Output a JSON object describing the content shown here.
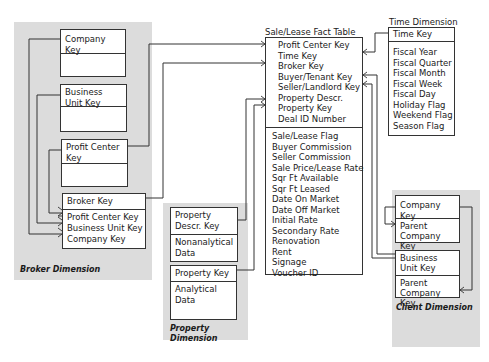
{
  "broker_dimension": {
    "label": "Broker Dimension",
    "company_table": {
      "key": "Company Key"
    },
    "business_unit_table": {
      "key": "Business Unit Key"
    },
    "profit_center_table": {
      "key": "Profit Center Key"
    },
    "broker_table": {
      "key": "Broker Key",
      "fields": [
        "Profit Center Key",
        "Business Unit Key",
        "Company Key"
      ]
    }
  },
  "property_dimension": {
    "label": "Property Dimension",
    "descr_table": {
      "key": "Property Descr. Key",
      "fields": [
        "Nonanalytical Data"
      ]
    },
    "property_table": {
      "key": "Property Key",
      "fields": [
        "Analytical Data"
      ]
    }
  },
  "fact_table": {
    "title": "Sale/Lease Fact Table",
    "keys": [
      "Profit Center Key",
      "Time Key",
      "Broker Key",
      "Buyer/Tenant Key",
      "Seller/Landlord Key",
      "Property Descr.",
      "Property Key",
      "Deal ID Number"
    ],
    "measures": [
      "Sale/Lease Flag",
      "Buyer Commission",
      "Seller Commission",
      "Sale Price/Lease Rate",
      "Sqr Ft Available",
      "Sqr Ft Leased",
      "Date On Market",
      "Date Off Market",
      "Initial Rate",
      "Secondary Rate",
      "Renovation",
      "Rent",
      "Signage",
      "Voucher ID"
    ]
  },
  "time_dimension": {
    "title": "Time Dimension",
    "key": "Time Key",
    "fields": [
      "Fiscal Year",
      "Fiscal Quarter",
      "Fiscal Month",
      "Fiscal Week",
      "Fiscal Day",
      "Holiday Flag",
      "Weekend Flag",
      "Season Flag"
    ]
  },
  "client_dimension": {
    "label": "Client Dimension",
    "company_table": {
      "key": "Company Key",
      "fields": [
        "Parent Company Key"
      ]
    },
    "business_unit_table": {
      "key": "Business Unit Key",
      "fields": [
        "Parent Company Key"
      ]
    }
  }
}
